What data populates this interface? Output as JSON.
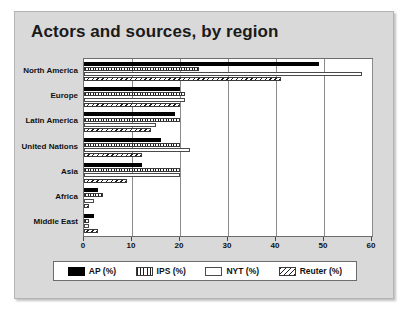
{
  "chart_data": {
    "type": "bar",
    "orientation": "horizontal",
    "title": "Actors and sources, by region",
    "xlabel": "",
    "ylabel": "",
    "xlim": [
      0,
      60
    ],
    "xticks": [
      0,
      10,
      20,
      30,
      40,
      50,
      60
    ],
    "grid": true,
    "legend_position": "bottom",
    "categories": [
      "North America",
      "Europe",
      "Latin America",
      "United Nations",
      "Asia",
      "Africa",
      "Middle East"
    ],
    "series": [
      {
        "name": "AP (%)",
        "pattern": "solid-black",
        "values": [
          49,
          20,
          19,
          16,
          12,
          3,
          2
        ]
      },
      {
        "name": "IPS (%)",
        "pattern": "vertical-stripes",
        "values": [
          24,
          21,
          20,
          20,
          20,
          4,
          1
        ]
      },
      {
        "name": "NYT (%)",
        "pattern": "white-empty",
        "values": [
          58,
          21,
          15,
          22,
          20,
          2,
          1
        ]
      },
      {
        "name": "Reuter (%)",
        "pattern": "diagonal-hatch",
        "values": [
          41,
          20,
          14,
          12,
          9,
          1,
          3
        ]
      }
    ]
  },
  "legend": {
    "entries": [
      {
        "label": "AP (%)",
        "swatch": "solid-black-swatch"
      },
      {
        "label": "IPS (%)",
        "swatch": "vertical-stripes-swatch"
      },
      {
        "label": "NYT (%)",
        "swatch": "white-empty-swatch"
      },
      {
        "label": "Reuter (%)",
        "swatch": "diagonal-hatch-swatch"
      }
    ]
  },
  "colors": {
    "panel_background": "#d9d9d9",
    "plot_background": "#ffffff",
    "axis": "#6d6d6d",
    "gridline": "#8a8a8a",
    "text": "#111111",
    "series_ap": "#000000"
  }
}
